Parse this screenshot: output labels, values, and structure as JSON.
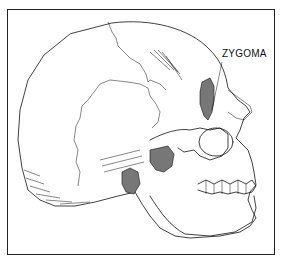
{
  "figure": {
    "labels": [
      {
        "text": "ZYGOMA",
        "points_to": "zygomatic-bone"
      }
    ]
  }
}
